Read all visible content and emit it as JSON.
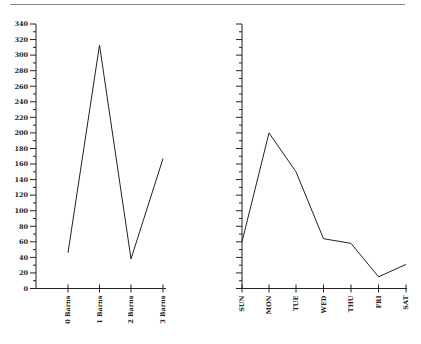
{
  "chart_data": [
    {
      "type": "line",
      "title": "",
      "xlabel": "",
      "ylabel": "",
      "categories": [
        "0 Barns",
        "1 Barns",
        "2 Barns",
        "3 Barns"
      ],
      "values": [
        46,
        313,
        38,
        167
      ],
      "ylim": [
        0,
        340
      ],
      "yticks": [
        0,
        20,
        40,
        60,
        80,
        100,
        120,
        140,
        160,
        180,
        200,
        220,
        240,
        260,
        280,
        300,
        320,
        340
      ],
      "grid": false,
      "legend": null
    },
    {
      "type": "line",
      "title": "",
      "xlabel": "",
      "ylabel": "",
      "categories": [
        "SUN",
        "MON",
        "TUE",
        "WED",
        "THU",
        "FRI",
        "SAT"
      ],
      "values": [
        60,
        200,
        150,
        64,
        58,
        15,
        31
      ],
      "ylim": [
        0,
        340
      ],
      "yticks_labeled": false,
      "grid": false,
      "legend": null
    }
  ],
  "colors": {
    "line": "#222222",
    "rule": "#888888"
  }
}
